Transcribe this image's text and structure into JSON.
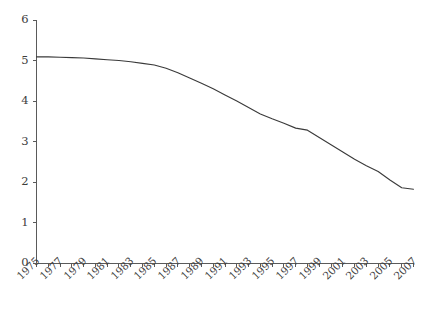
{
  "chart_data": {
    "type": "line",
    "title": "",
    "subtitle": "",
    "xlabel": "",
    "ylabel": "",
    "xlim": [
      1975,
      2007
    ],
    "ylim": [
      0,
      6
    ],
    "grid": false,
    "legend": false,
    "legend_position": "none",
    "line_color": "#3a3a3a",
    "axis_color": "#5a5a5a",
    "background_color": "#ffffff",
    "y_ticks": [
      0,
      1,
      2,
      3,
      4,
      5,
      6
    ],
    "y_tick_labels": [
      "0",
      "1",
      "2",
      "3",
      "4",
      "5",
      "6"
    ],
    "x_ticks": [
      1975,
      1976,
      1977,
      1978,
      1979,
      1980,
      1981,
      1982,
      1983,
      1984,
      1985,
      1986,
      1987,
      1988,
      1989,
      1990,
      1991,
      1992,
      1993,
      1994,
      1995,
      1996,
      1997,
      1998,
      1999,
      2000,
      2001,
      2002,
      2003,
      2004,
      2005,
      2006,
      2007
    ],
    "x_tick_labels": [
      "1975",
      "",
      "1977",
      "",
      "1979",
      "",
      "1981",
      "",
      "1983",
      "",
      "1985",
      "",
      "1987",
      "",
      "1989",
      "",
      "1991",
      "",
      "1993",
      "",
      "1995",
      "",
      "1997",
      "",
      "1999",
      "",
      "2001",
      "",
      "2003",
      "",
      "2005",
      "",
      "2007"
    ],
    "x": [
      1975,
      1976,
      1977,
      1978,
      1979,
      1980,
      1981,
      1982,
      1983,
      1984,
      1985,
      1986,
      1987,
      1988,
      1989,
      1990,
      1991,
      1992,
      1993,
      1994,
      1995,
      1996,
      1997,
      1998,
      1999,
      2000,
      2001,
      2002,
      2003,
      2004,
      2005,
      2006,
      2007
    ],
    "values": [
      5.09,
      5.09,
      5.08,
      5.07,
      5.06,
      5.04,
      5.02,
      5.0,
      4.97,
      4.93,
      4.89,
      4.81,
      4.7,
      4.57,
      4.44,
      4.3,
      4.15,
      4.0,
      3.84,
      3.68,
      3.56,
      3.45,
      3.33,
      3.28,
      3.1,
      2.92,
      2.74,
      2.56,
      2.4,
      2.26,
      2.05,
      1.86,
      1.82
    ],
    "series": [
      {
        "name": "series-1",
        "values": [
          5.09,
          5.09,
          5.08,
          5.07,
          5.06,
          5.04,
          5.02,
          5.0,
          4.97,
          4.93,
          4.89,
          4.81,
          4.7,
          4.57,
          4.44,
          4.3,
          4.15,
          4.0,
          3.84,
          3.68,
          3.56,
          3.45,
          3.33,
          3.28,
          3.1,
          2.92,
          2.74,
          2.56,
          2.4,
          2.26,
          2.05,
          1.86,
          1.82
        ]
      }
    ]
  }
}
